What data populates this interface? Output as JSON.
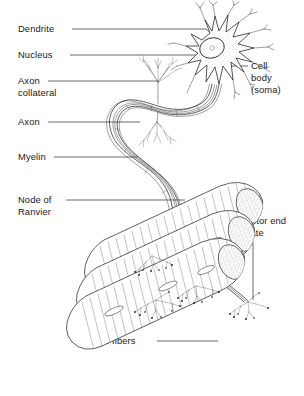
{
  "figure": {
    "background_color": "#ffffff",
    "ink_color": "#1b1b1b",
    "width": 304,
    "height": 396
  },
  "labels": {
    "dendrite": "Dendrite",
    "nucleus": "Nucleus",
    "axon_collateral_line1": "Axon",
    "axon_collateral_line2": "collateral",
    "axon": "Axon",
    "myelin": "Myelin",
    "node_of_ranvier_line1": "Node of",
    "node_of_ranvier_line2": "Ranvier",
    "cell_body_line1": "Cell",
    "cell_body_line2": "body",
    "cell_body_line3": "(soma)",
    "motor_end_plate_line1": "Motor end",
    "motor_end_plate_line2": "plate",
    "muscle_fibers": "Muscle fibers"
  },
  "structures": {
    "soma": "cell-body-soma",
    "nucleus": "nucleus-oval",
    "dendrites": "dendritic-branches",
    "axon": "myelinated-axon",
    "axon_collateral": "axon-collateral-branch",
    "myelin_sheath": "myelin-sheath",
    "nodes_of_ranvier": "node-of-ranvier",
    "muscle_fibers": "muscle-fiber-bundle",
    "motor_end_plates": "motor-end-plate-terminals"
  }
}
